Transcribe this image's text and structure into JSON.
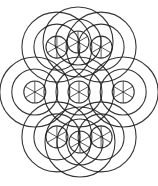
{
  "figure": {
    "style": "pencil line art",
    "colors": {
      "ink": "#1a1a1a",
      "paper": "#ffffff"
    },
    "groups": {
      "satellite_count": 6,
      "includes_center_group": true,
      "rings_per_group": 3,
      "spokes_per_group": 6
    }
  }
}
